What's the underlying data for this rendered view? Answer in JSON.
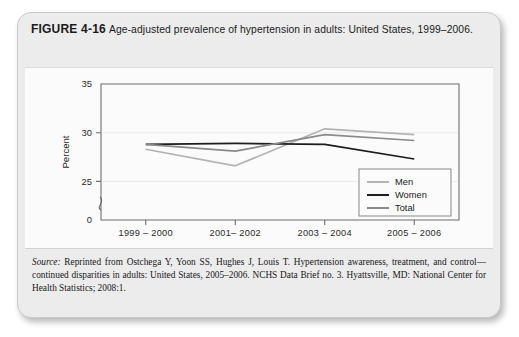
{
  "figure": {
    "label": "FIGURE 4-16",
    "caption": "Age-adjusted prevalence of hypertension in adults: United States, 1999–2006."
  },
  "source": {
    "prefix": "Source:",
    "text": " Reprinted from Ostchega Y, Yoon SS, Hughes J, Louis T. Hypertension awareness, treatment, and control—continued disparities in adults: United States, 2005–2006. NCHS Data Brief no. 3. Hyattsville, MD: National Center for Health Statistics; 2008:1."
  },
  "chart_data": {
    "type": "line",
    "title": "",
    "xlabel": "",
    "ylabel": "Percent",
    "categories": [
      "1999 – 2000",
      "2001– 2002",
      "2003 – 2004",
      "2005 – 2006"
    ],
    "yticks": [
      0,
      25,
      30,
      35
    ],
    "ytick_labels": [
      "0",
      "25",
      "30",
      "35"
    ],
    "ylim": [
      23.5,
      35
    ],
    "axis_break": true,
    "axis_break_note": "y-axis broken between 0 and 25",
    "grid": false,
    "legend_position": "bottom-right",
    "series": [
      {
        "name": "Men",
        "color": "#b3b3b3",
        "values": [
          28.3,
          26.6,
          30.4,
          29.8
        ]
      },
      {
        "name": "Women",
        "color": "#1d1d1d",
        "values": [
          28.8,
          28.9,
          28.8,
          27.3
        ]
      },
      {
        "name": "Total",
        "color": "#8a8a8a",
        "values": [
          28.8,
          28.1,
          29.8,
          29.2
        ]
      }
    ]
  },
  "legend": {
    "items": [
      "Men",
      "Women",
      "Total"
    ]
  }
}
